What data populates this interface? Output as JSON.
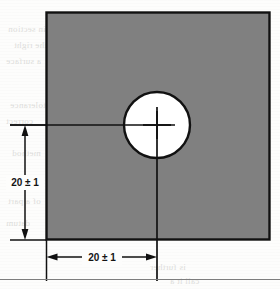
{
  "figure": {
    "type": "engineering-drawing",
    "plate": {
      "fill_color": "#808080",
      "outline_color": "#111111",
      "shape": "square"
    },
    "hole": {
      "fill_color": "#ffffff",
      "outline_color": "#111111",
      "shape": "circle",
      "center_mark": "crosshair"
    }
  },
  "dimensions": [
    {
      "id": "vertical-dimension",
      "label": "20 ± 1",
      "nominal": 20,
      "tolerance": 1,
      "orientation": "vertical",
      "measures": "hole centerline to bottom edge"
    },
    {
      "id": "horizontal-dimension",
      "label": "20 ± 1",
      "nominal": 20,
      "tolerance": 1,
      "orientation": "horizontal",
      "measures": "left edge to hole centerline"
    }
  ],
  "colors": {
    "plate_gray": "#808080",
    "line_black": "#111111",
    "hole_white": "#ffffff",
    "page_white": "#fdfdfc",
    "rule_gray": "#7e7e7e"
  },
  "bleed_through_text": [
    {
      "text": "in section",
      "x": 8,
      "y": 24
    },
    {
      "text": "the right",
      "x": 14,
      "y": 40
    },
    {
      "text": "a surface",
      "x": 6,
      "y": 56
    },
    {
      "text": "tolerance",
      "x": 10,
      "y": 100
    },
    {
      "text": "correct",
      "x": 6,
      "y": 116
    },
    {
      "text": "method",
      "x": 12,
      "y": 148
    },
    {
      "text": "of a part",
      "x": 8,
      "y": 196
    },
    {
      "text": "datum",
      "x": 6,
      "y": 218
    },
    {
      "text": "is further",
      "x": 150,
      "y": 262
    },
    {
      "text": "call it a",
      "x": 170,
      "y": 276
    },
    {
      "text": "position",
      "x": 186,
      "y": 36
    },
    {
      "text": "feature",
      "x": 196,
      "y": 88
    }
  ]
}
